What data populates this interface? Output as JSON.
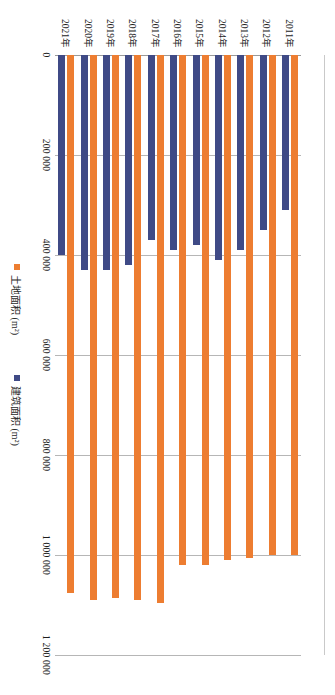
{
  "chart_data": {
    "type": "bar",
    "orientation": "horizontal",
    "title": "",
    "xlabel": "",
    "ylabel": "",
    "categories": [
      "2011年",
      "2012年",
      "2013年",
      "2014年",
      "2015年",
      "2016年",
      "2017年",
      "2018年",
      "2019年",
      "2020年",
      "2021年"
    ],
    "series": [
      {
        "name": "建筑面积 (m²)",
        "color": "#3f4a86",
        "values": [
          310000,
          350000,
          390000,
          410000,
          380000,
          390000,
          370000,
          420000,
          430000,
          430000,
          400000
        ]
      },
      {
        "name": "土地面积 (m²)",
        "color": "#ed7d31",
        "values": [
          1000000,
          1000000,
          1005000,
          1010000,
          1020000,
          1020000,
          1095000,
          1090000,
          1085000,
          1090000,
          1075000
        ]
      }
    ],
    "value_axis": {
      "min": 0,
      "max": 1200000,
      "tick_step": 200000,
      "tick_labels": [
        "0",
        "200 000",
        "400 000",
        "600 000",
        "800 000",
        "1 000 000",
        "1 200 000"
      ],
      "tick_values": [
        0,
        200000,
        400000,
        600000,
        800000,
        1000000,
        1200000
      ]
    },
    "grid": true,
    "legend_position": "bottom"
  }
}
